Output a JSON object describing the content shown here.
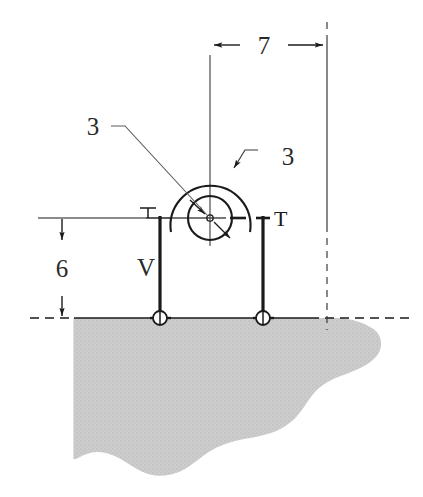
{
  "figure": {
    "kind": "engineering-statics-diagram",
    "background_color": "#ffffff",
    "line_color": "#1a1a1a",
    "thin_line_color": "#4a4a4a",
    "ground_fill_color": "#c9c9c9",
    "ground_edge_color": "#b4b4b4"
  },
  "dimensions": {
    "horizontal": {
      "value": "7",
      "name": "width-dimension"
    },
    "vertical": {
      "value": "6",
      "name": "height-dimension"
    }
  },
  "labels": {
    "radius_left": "3",
    "radius_right": "3",
    "member_v": "V",
    "section_left": "T",
    "section_right": "T"
  },
  "caption": {
    "text": ""
  }
}
